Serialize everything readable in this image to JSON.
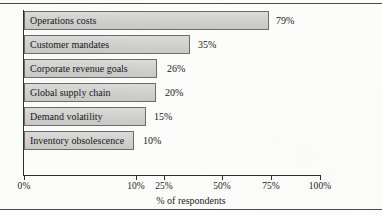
{
  "figure": {
    "title_fragment": ".",
    "axis_title": "% of respondents",
    "rules": {
      "top": "horizontal-rule",
      "bottom": "horizontal-rule"
    }
  },
  "chart_data": {
    "type": "bar",
    "orientation": "horizontal",
    "title": "",
    "xlabel": "% of respondents",
    "ylabel": "",
    "xlim": [
      0,
      100
    ],
    "grid": false,
    "legend": null,
    "categories": [
      "Operations costs",
      "Customer mandates",
      "Corporate revenue goals",
      "Global supply chain",
      "Demand volatility",
      "Inventory obsolescence"
    ],
    "values": [
      79,
      35,
      26,
      20,
      15,
      10
    ],
    "data_labels": [
      "79%",
      "35%",
      "26%",
      "20%",
      "15%",
      "10%"
    ],
    "xtick_values": [
      0,
      10,
      25,
      50,
      75,
      100
    ],
    "xtick_labels": [
      "0%",
      "10%",
      "25%",
      "50%",
      "75%",
      "100%"
    ],
    "bar_fill_color": "#d2d2d0",
    "bar_border_color": "#6c6c6c"
  },
  "bars": [
    {
      "label": "Operations costs",
      "value_label": "79%",
      "px_width": 245,
      "px_top": 6,
      "label_gap": 7
    },
    {
      "label": "Customer mandates",
      "value_label": "35%",
      "px_width": 166,
      "px_top": 30,
      "label_gap": 8
    },
    {
      "label": "Corporate revenue goals",
      "value_label": "26%",
      "px_width": 133,
      "px_top": 54,
      "label_gap": 10
    },
    {
      "label": "Global supply chain",
      "value_label": "20%",
      "px_width": 132,
      "px_top": 78,
      "label_gap": 9
    },
    {
      "label": "Demand volatility",
      "value_label": "15%",
      "px_width": 122,
      "px_top": 102,
      "label_gap": 8
    },
    {
      "label": "Inventory obsolescence",
      "value_label": "10%",
      "px_width": 110,
      "px_top": 126,
      "label_gap": 9
    }
  ],
  "ticks": [
    {
      "label": "0%",
      "px_x": 24
    },
    {
      "label": "10%",
      "px_x": 136
    },
    {
      "label": "25%",
      "px_x": 164
    },
    {
      "label": "50%",
      "px_x": 222
    },
    {
      "label": "75%",
      "px_x": 271
    },
    {
      "label": "100%",
      "px_x": 320
    }
  ]
}
